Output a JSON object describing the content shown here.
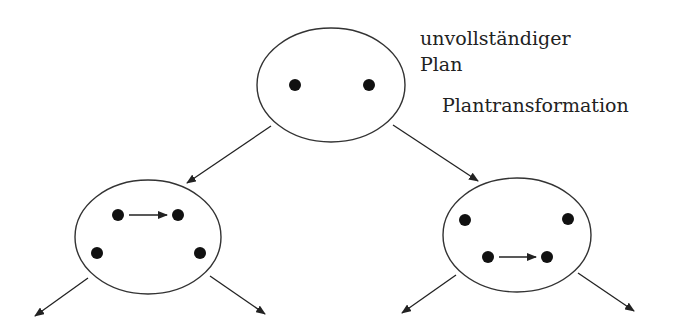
{
  "labels": {
    "top_line1": "unvollständiger",
    "top_line2": "Plan",
    "transformation": "Plantransformation"
  },
  "colors": {
    "stroke": "#333333",
    "dot": "#111111",
    "background": "#ffffff"
  },
  "nodes": [
    {
      "id": "root",
      "cx": 331,
      "cy": 85,
      "rx": 74,
      "ry": 57,
      "dots": [
        [
          295,
          85
        ],
        [
          369,
          85
        ]
      ],
      "inner_arrows": []
    },
    {
      "id": "left-child",
      "cx": 148,
      "cy": 237,
      "rx": 73,
      "ry": 57,
      "dots": [
        [
          118,
          215
        ],
        [
          178,
          215
        ],
        [
          97,
          253
        ],
        [
          200,
          253
        ]
      ],
      "inner_arrows": [
        [
          129,
          215,
          167,
          215
        ]
      ]
    },
    {
      "id": "right-child",
      "cx": 517,
      "cy": 235,
      "rx": 74,
      "ry": 57,
      "dots": [
        [
          465,
          220
        ],
        [
          568,
          219
        ],
        [
          488,
          257
        ],
        [
          547,
          257
        ]
      ],
      "inner_arrows": [
        [
          499,
          257,
          536,
          257
        ]
      ]
    }
  ],
  "edges": [
    [
      271,
      126,
      187,
      183
    ],
    [
      393,
      125,
      478,
      181
    ],
    [
      88,
      278,
      35,
      316
    ],
    [
      210,
      276,
      265,
      314
    ],
    [
      456,
      275,
      402,
      313
    ],
    [
      578,
      273,
      634,
      311
    ]
  ]
}
